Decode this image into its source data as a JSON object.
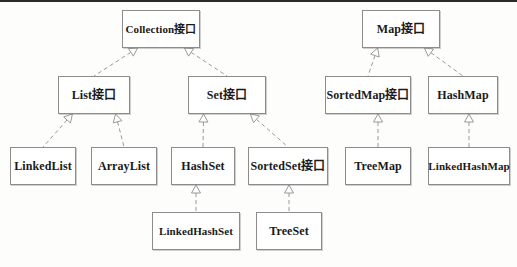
{
  "diagram": {
    "style": {
      "background": "#fdfdfb",
      "box_fill": "#ffffff",
      "box_border": "#8c8c8c",
      "text_color": "#1a1a1a",
      "connector_color": "#9a9a9a",
      "connector_style": "dashed",
      "arrowhead": "hollow-triangle"
    },
    "nodes": [
      {
        "id": "collection",
        "label": "Collection接口",
        "x": 122,
        "y": 10,
        "w": 78,
        "h": 38,
        "kind": "interface"
      },
      {
        "id": "map",
        "label": "Map接口",
        "x": 362,
        "y": 10,
        "w": 78,
        "h": 38,
        "kind": "interface"
      },
      {
        "id": "list",
        "label": "List接口",
        "x": 58,
        "y": 76,
        "w": 72,
        "h": 38,
        "kind": "interface"
      },
      {
        "id": "set",
        "label": "Set接口",
        "x": 188,
        "y": 76,
        "w": 78,
        "h": 38,
        "kind": "interface"
      },
      {
        "id": "sortedmap",
        "label": "SortedMap接口",
        "x": 325,
        "y": 76,
        "w": 86,
        "h": 38,
        "kind": "interface"
      },
      {
        "id": "hashmap",
        "label": "HashMap",
        "x": 428,
        "y": 76,
        "w": 70,
        "h": 38,
        "kind": "class"
      },
      {
        "id": "linkedlist",
        "label": "LinkedList",
        "x": 10,
        "y": 147,
        "w": 66,
        "h": 38,
        "kind": "class"
      },
      {
        "id": "arraylist",
        "label": "ArrayList",
        "x": 91,
        "y": 147,
        "w": 66,
        "h": 38,
        "kind": "class"
      },
      {
        "id": "hashset",
        "label": "HashSet",
        "x": 171,
        "y": 147,
        "w": 64,
        "h": 38,
        "kind": "class"
      },
      {
        "id": "sortedset",
        "label": "SortedSet接口",
        "x": 248,
        "y": 147,
        "w": 80,
        "h": 38,
        "kind": "interface"
      },
      {
        "id": "treemap",
        "label": "TreeMap",
        "x": 345,
        "y": 147,
        "w": 66,
        "h": 38,
        "kind": "class"
      },
      {
        "id": "linkedhashmap",
        "label": "LinkedHashMap",
        "x": 428,
        "y": 147,
        "w": 82,
        "h": 38,
        "kind": "class"
      },
      {
        "id": "linkedhashset",
        "label": "LinkedHashSet",
        "x": 152,
        "y": 212,
        "w": 88,
        "h": 38,
        "kind": "class"
      },
      {
        "id": "treeset",
        "label": "TreeSet",
        "x": 256,
        "y": 212,
        "w": 66,
        "h": 38,
        "kind": "class"
      }
    ],
    "edges": [
      {
        "from": "list",
        "to": "collection",
        "label": "implements"
      },
      {
        "from": "set",
        "to": "collection",
        "label": "implements"
      },
      {
        "from": "linkedlist",
        "to": "list",
        "label": "implements"
      },
      {
        "from": "arraylist",
        "to": "list",
        "label": "implements"
      },
      {
        "from": "hashset",
        "to": "set",
        "label": "implements"
      },
      {
        "from": "sortedset",
        "to": "set",
        "label": "implements"
      },
      {
        "from": "linkedhashset",
        "to": "hashset",
        "label": "extends"
      },
      {
        "from": "treeset",
        "to": "sortedset",
        "label": "implements"
      },
      {
        "from": "sortedmap",
        "to": "map",
        "label": "implements"
      },
      {
        "from": "hashmap",
        "to": "map",
        "label": "implements"
      },
      {
        "from": "treemap",
        "to": "sortedmap",
        "label": "implements"
      },
      {
        "from": "linkedhashmap",
        "to": "hashmap",
        "label": "extends"
      }
    ]
  }
}
